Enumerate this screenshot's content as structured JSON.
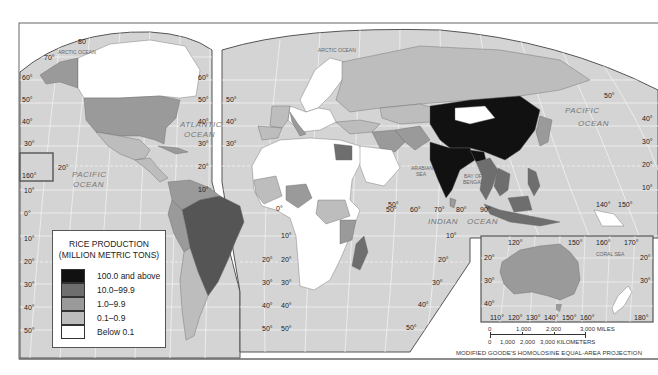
{
  "map": {
    "title": "Rice Production",
    "projection": "MODIFIED GOODE'S HOMOLOSINE EQUAL-AREA PROJECTION",
    "colors": {
      "ocean": "#d4d4d4",
      "graticule": "#f4f4f4",
      "class_100_plus": "#111111",
      "class_10_99": "#6e6e6e",
      "class_1_9": "#9a9a9a",
      "class_01_09": "#bdbdbd",
      "class_below_01": "#ffffff",
      "border": "#555555"
    },
    "ocean_labels": {
      "arctic_west": "ARCTIC OCEAN",
      "arctic_east": "ARCTIC OCEAN",
      "atlantic_1": "ATLANTIC",
      "atlantic_2": "OCEAN",
      "pacific_west_1": "PACIFIC",
      "pacific_west_2": "OCEAN",
      "pacific_east_1": "PACIFIC",
      "pacific_east_2": "OCEAN",
      "indian_1": "INDIAN",
      "indian_2": "OCEAN",
      "arabian_1": "ARABIAN",
      "arabian_2": "SEA",
      "bengal_1": "BAY OF",
      "bengal_2": "BENGAL",
      "coral": "CORAL   SEA"
    },
    "latitude_labels_west": [
      "70°",
      "60°",
      "50°",
      "40°",
      "30°",
      "20°",
      "10°",
      "0°",
      "10°",
      "20°",
      "30°",
      "40°",
      "50°"
    ],
    "latitude_labels_mid_atlantic": [
      "60°",
      "50°",
      "40°",
      "30°",
      "20°",
      "10°",
      "10°",
      "20°",
      "30°",
      "40°",
      "50°"
    ],
    "latitude_labels_east": [
      "50°",
      "40°",
      "30°",
      "20°",
      "10°"
    ],
    "longitude_labels_indian": [
      "50°",
      "60°",
      "70°",
      "80°",
      "90°"
    ],
    "longitude_labels_pacific": [
      "140°",
      "150°"
    ],
    "other_degree_labels": {
      "arctic_80": "80",
      "hawaii_160": "160°",
      "hawaii_20": "20°",
      "africa_0": "0°",
      "africa_50": "50°",
      "indian_10": "10°",
      "africa_s_40": "40°",
      "africa_s_50": "50°",
      "africa_s_20": "20°",
      "africa_s_30": "30°"
    },
    "inset": {
      "name": "Australia inset",
      "top_labels": [
        "120°",
        "150°",
        "160°",
        "170°"
      ],
      "bottom_labels": [
        "110°",
        "120°",
        "130°",
        "140°",
        "150°",
        "160°",
        "180°"
      ],
      "left_labels": [
        "20°",
        "30°",
        "40°"
      ],
      "right_labels": [
        "20°",
        "30°"
      ]
    }
  },
  "legend": {
    "title_line1": "RICE PRODUCTION",
    "title_line2": "(MILLION METRIC TONS)",
    "items": [
      {
        "label": "100.0 and above",
        "color": "#111111"
      },
      {
        "label": "10.0–99.9",
        "color": "#6e6e6e"
      },
      {
        "label": "1.0–9.9",
        "color": "#9a9a9a"
      },
      {
        "label": "0.1–0.9",
        "color": "#bdbdbd"
      },
      {
        "label": "Below 0.1",
        "color": "#ffffff"
      }
    ]
  },
  "scale": {
    "miles_ticks": [
      "0",
      "1,000",
      "2,000",
      "3,000 MILES"
    ],
    "km_ticks": [
      "0",
      "1,000",
      "2,000",
      "3,000 KILOMETERS"
    ]
  }
}
